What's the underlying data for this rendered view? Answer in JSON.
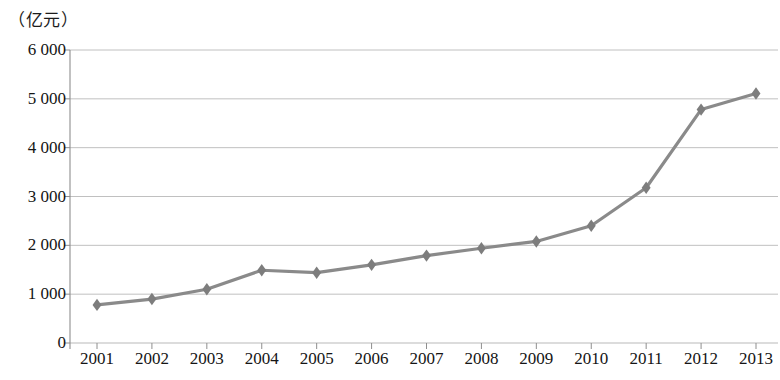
{
  "chart_data": {
    "type": "line",
    "title": "",
    "subtitle": "",
    "unit_label": "（亿元）",
    "xlabel": "",
    "ylabel": "",
    "categories": [
      "2001",
      "2002",
      "2003",
      "2004",
      "2005",
      "2006",
      "2007",
      "2008",
      "2009",
      "2010",
      "2011",
      "2012",
      "2013"
    ],
    "values": [
      780,
      900,
      1100,
      1490,
      1440,
      1600,
      1790,
      1940,
      2080,
      2400,
      3180,
      4780,
      5110
    ],
    "series": [
      {
        "name": "",
        "values": [
          780,
          900,
          1100,
          1490,
          1440,
          1600,
          1790,
          1940,
          2080,
          2400,
          3180,
          4780,
          5110
        ]
      }
    ],
    "ylim": [
      0,
      6000
    ],
    "y_ticks": [
      0,
      1000,
      2000,
      3000,
      4000,
      5000,
      6000
    ],
    "y_tick_labels": [
      "0",
      "1 000",
      "2 000",
      "3 000",
      "4 000",
      "5 000",
      "6 000"
    ],
    "grid": true,
    "grid_axis": "y",
    "legend": false,
    "legend_position": "none",
    "marker": "diamond",
    "line_color": "#8a8a8a",
    "marker_color": "#7d7d7d",
    "grid_color": "#b9b9b9",
    "axis_color": "#8e8e8e",
    "text_color": "#151515"
  }
}
